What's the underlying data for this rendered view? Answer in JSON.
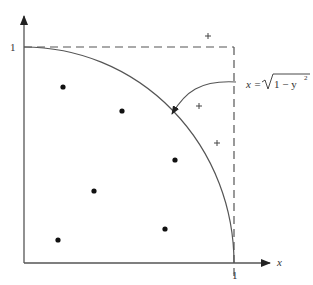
{
  "diagram": {
    "axes": {
      "x_label": "x",
      "y_tick_label": "1",
      "x_tick_label": "1"
    },
    "curve": {
      "equation_lhs": "x = ",
      "equation_radicand": "1 − y",
      "equation_exponent": "2",
      "description": "quarter circle x = sqrt(1 - y^2)"
    },
    "inside_points": [
      {
        "x": 63,
        "y": 87
      },
      {
        "x": 122,
        "y": 111
      },
      {
        "x": 175,
        "y": 160
      },
      {
        "x": 94,
        "y": 191
      },
      {
        "x": 57,
        "y": 240
      },
      {
        "x": 165,
        "y": 229
      }
    ],
    "outside_points": [
      {
        "x": 208,
        "y": 36
      },
      {
        "x": 199,
        "y": 106
      },
      {
        "x": 217,
        "y": 143
      }
    ],
    "colors": {
      "stroke": "#555555",
      "point": "#111111"
    }
  }
}
